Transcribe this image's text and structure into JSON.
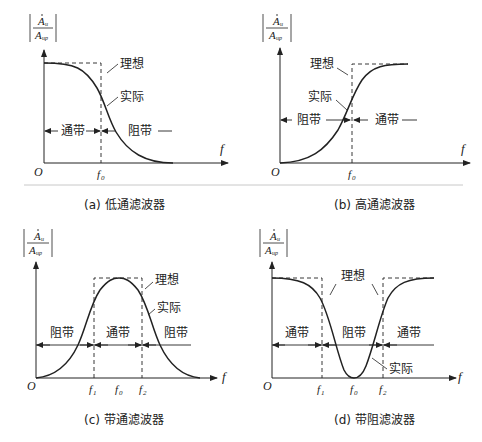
{
  "figure": {
    "y_axis_label": {
      "numerator": "A",
      "numerator_sub": "u",
      "denominator": "A",
      "denominator_sub": "up"
    },
    "x_axis_label": "f",
    "origin_label": "O",
    "ideal_label": "理想",
    "actual_label": "实际",
    "passband_label": "通带",
    "stopband_label": "阻带",
    "panels": [
      {
        "id": "a",
        "caption": "(a) 低通滤波器",
        "f_labels": [
          "f",
          "0"
        ]
      },
      {
        "id": "b",
        "caption": "(b) 高通滤波器",
        "f_labels": [
          "f",
          "0"
        ]
      },
      {
        "id": "c",
        "caption": "(c) 带通滤波器",
        "f1": "1",
        "f0": "0",
        "f2": "2"
      },
      {
        "id": "d",
        "caption": "(d) 带阻滤波器",
        "f1": "1",
        "f0": "0",
        "f2": "2"
      }
    ]
  },
  "colors": {
    "line": "#222222",
    "separator": "#c8c8c8",
    "background": "#ffffff"
  }
}
